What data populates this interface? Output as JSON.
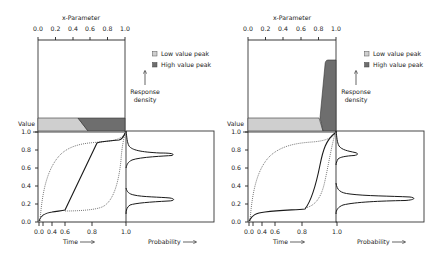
{
  "figures": [
    {
      "top_axis": {
        "title": "x-Parameter",
        "ticks": [
          "0.0",
          "0.2",
          "0.4",
          "0.6",
          "0.8",
          "1.0"
        ]
      },
      "legend": {
        "low": "Low value peak",
        "high": "High value peak"
      },
      "response_label": [
        "Response",
        "density"
      ],
      "value_label": "Value",
      "y_ticks": [
        "1.0",
        "0.8",
        "0.6",
        "0.4",
        "0.2",
        "0.0"
      ],
      "time_ticks": [
        "0.0",
        "0.4",
        "0.6",
        "0.8"
      ],
      "time_end_tick": "1.0",
      "time_label": "Time",
      "probability_label": "Probability"
    },
    {
      "top_axis": {
        "title": "x-Parameter",
        "ticks": [
          "0.0",
          "0.2",
          "0.4",
          "0.6",
          "0.8",
          "1.0"
        ]
      },
      "legend": {
        "low": "Low value peak",
        "high": "High value peak"
      },
      "response_label": [
        "Response",
        "density"
      ],
      "value_label": "Value",
      "y_ticks": [
        "1.0",
        "0.8",
        "0.6",
        "0.4",
        "0.2",
        "0.0"
      ],
      "time_ticks": [
        "0.0",
        "0.4",
        "0.6",
        "0.8"
      ],
      "time_end_tick": "1.0",
      "time_label": "Time",
      "probability_label": "Probability"
    }
  ],
  "colors": {
    "low_peak": "#cfcfcf",
    "high_peak": "#6e6e6e",
    "line": "#1a1a1a"
  },
  "arrow_glyph": "→"
}
